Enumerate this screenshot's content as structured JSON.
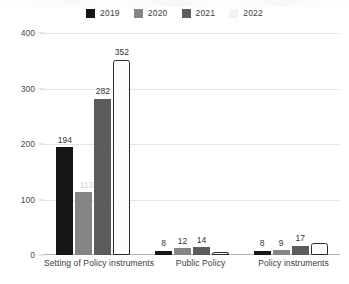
{
  "chart_data": {
    "type": "bar",
    "title": "",
    "subtitle": "",
    "xlabel": "",
    "ylabel": "",
    "ylim": [
      0,
      400
    ],
    "yticks": [
      "0",
      "100",
      "200",
      "300",
      "400"
    ],
    "grid": true,
    "legend_position": "top-center",
    "categories": [
      "Setting of Policy instruments",
      "Public Policy",
      "Policy instruments"
    ],
    "series": [
      {
        "name": "2019",
        "color": "#161616",
        "values": [
          194,
          8,
          8
        ]
      },
      {
        "name": "2020",
        "color": "#858585",
        "values": [
          113,
          12,
          9
        ]
      },
      {
        "name": "2021",
        "color": "#5c5c5c",
        "values": [
          282,
          14,
          17
        ]
      },
      {
        "name": "2022",
        "color": "#fcfcfc",
        "values": [
          352,
          5,
          22
        ]
      }
    ],
    "data_labels": [
      [
        "194",
        "8",
        "8"
      ],
      [
        "113",
        "12",
        "9"
      ],
      [
        "282",
        "14",
        "17"
      ],
      [
        "352",
        "",
        ""
      ]
    ]
  },
  "legend": {
    "items": [
      {
        "label": "2019",
        "color": "#161616"
      },
      {
        "label": "2020",
        "color": "#858585"
      },
      {
        "label": "2021",
        "color": "#5c5c5c"
      },
      {
        "label": "2022",
        "color": "#fcfcfc"
      }
    ]
  }
}
